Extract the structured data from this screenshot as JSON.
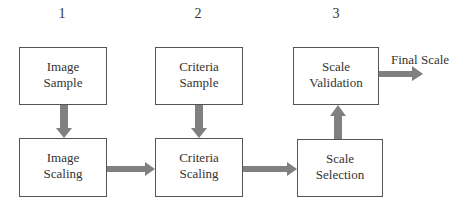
{
  "columns": [
    {
      "number": "1",
      "top_box": [
        "Image",
        "Sample"
      ],
      "bottom_box": [
        "Image",
        "Scaling"
      ]
    },
    {
      "number": "2",
      "top_box": [
        "Criteria",
        "Sample"
      ],
      "bottom_box": [
        "Criteria",
        "Scaling"
      ]
    },
    {
      "number": "3",
      "top_box": [
        "Scale",
        "Validation"
      ],
      "bottom_box": [
        "Scale",
        "Selection"
      ]
    }
  ],
  "output_label": "Final Scale",
  "colors": {
    "arrow": "#808080",
    "border": "#555555",
    "text": "#333333"
  }
}
